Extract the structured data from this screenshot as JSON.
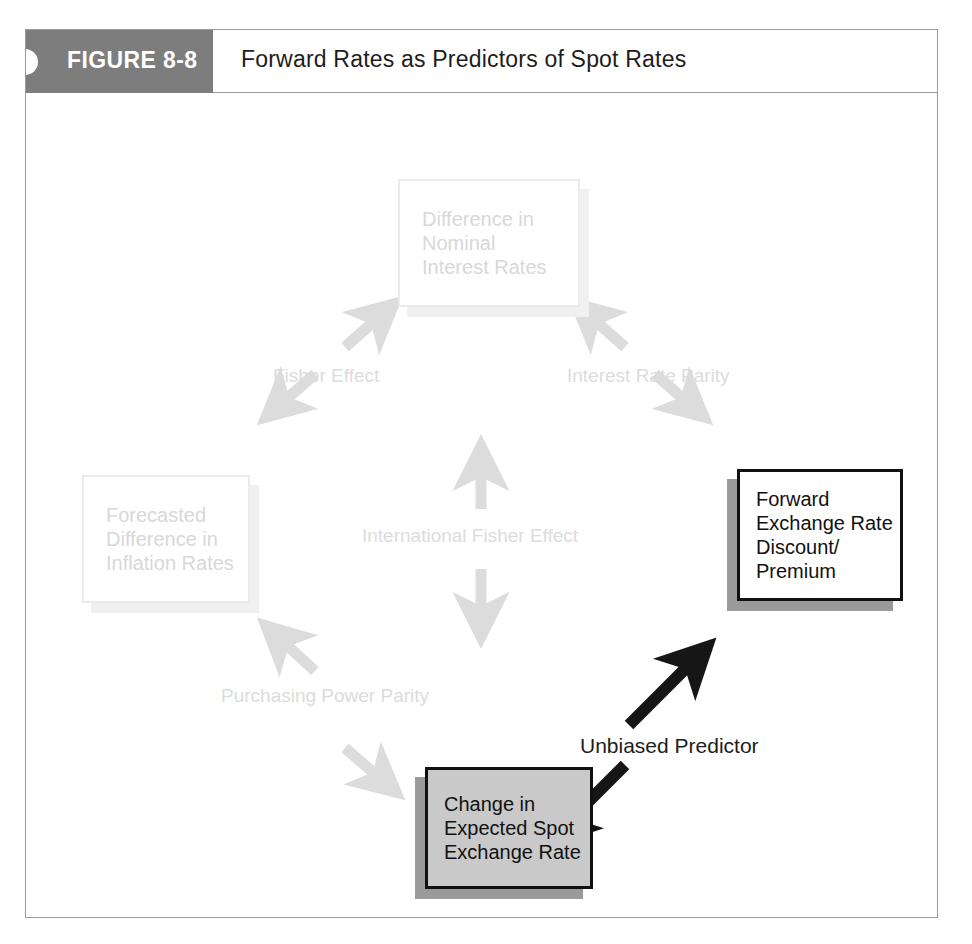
{
  "figure": {
    "tag": "FIGURE 8-8",
    "title": "Forward Rates as Predictors of Spot Rates"
  },
  "nodes": [
    {
      "id": "nominal-interest-rates",
      "text": "Difference in\nNominal\nInterest Rates",
      "emphasis": "faded"
    },
    {
      "id": "inflation-rates",
      "text": "Forecasted\nDifference in\nInflation Rates",
      "emphasis": "faded"
    },
    {
      "id": "forward-exchange-rate",
      "text": "Forward\nExchange Rate\nDiscount/\nPremium",
      "emphasis": "highlight-white"
    },
    {
      "id": "expected-spot-rate",
      "text": "Change in\nExpected Spot\nExchange Rate",
      "emphasis": "highlight-gray"
    }
  ],
  "edge_labels": [
    {
      "id": "fisher-effect",
      "text": "Fisher Effect",
      "emphasis": "faint"
    },
    {
      "id": "interest-rate-parity",
      "text": "Interest Rate Parity",
      "emphasis": "faint"
    },
    {
      "id": "international-fisher-effect",
      "text": "International Fisher Effect",
      "emphasis": "faint"
    },
    {
      "id": "purchasing-power-parity",
      "text": "Purchasing Power Parity",
      "emphasis": "faint"
    },
    {
      "id": "unbiased-predictor",
      "text": "Unbiased Predictor",
      "emphasis": "strong"
    }
  ],
  "colors": {
    "tag_background": "#7d7d7d",
    "tag_text": "#ffffff",
    "faint_gray": "#dcdcdc",
    "box_gray_fill": "#c9c9c9",
    "shadow_gray": "#9a9a9a",
    "frame_border": "#9b9b9b",
    "emphasis_black": "#111111"
  }
}
